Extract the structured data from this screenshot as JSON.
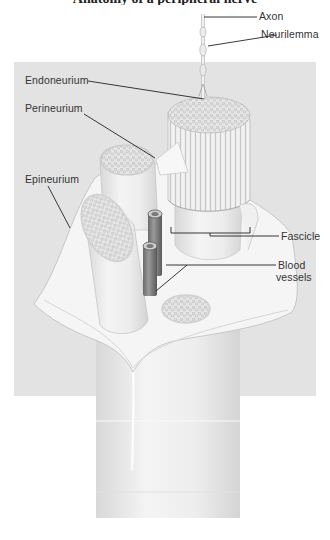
{
  "figure": {
    "title_cutoff": "Anatomy of a peripheral nerve",
    "background_color": "#e3e3e3",
    "line_color": "#222222",
    "labels": {
      "axon": "Axon",
      "neurilemma": "Neurilemma",
      "endoneurium": "Endoneurium",
      "perineurium": "Perineurium",
      "epineurium": "Epineurium",
      "fascicle": "Fascicle",
      "blood_vessels_line1": "Blood",
      "blood_vessels_line2": "vessels"
    }
  }
}
